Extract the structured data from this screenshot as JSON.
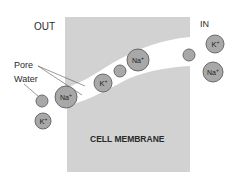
{
  "labels": {
    "out": "OUT",
    "in": "IN",
    "pore": "Pore",
    "water": "Water",
    "membrane": "CELL MEMBRANE"
  },
  "ions": [
    {
      "type": "K",
      "label": "K",
      "sup": "+",
      "cx": 103,
      "cy": 83,
      "r": 9
    },
    {
      "type": "water",
      "cx": 120,
      "cy": 71,
      "r": 6
    },
    {
      "type": "Na",
      "label": "Na",
      "sup": "+",
      "cx": 138,
      "cy": 60,
      "r": 11
    },
    {
      "type": "water",
      "cx": 189,
      "cy": 55,
      "r": 6
    },
    {
      "type": "K",
      "label": "K",
      "sup": "+",
      "cx": 215,
      "cy": 44,
      "r": 9
    },
    {
      "type": "Na",
      "label": "Na",
      "sup": "+",
      "cx": 213,
      "cy": 72,
      "r": 10
    },
    {
      "type": "Na",
      "label": "Na",
      "sup": "+",
      "cx": 66,
      "cy": 97,
      "r": 11
    },
    {
      "type": "water",
      "cx": 42,
      "cy": 101,
      "r": 6
    },
    {
      "type": "K",
      "label": "K",
      "sup": "+",
      "cx": 43,
      "cy": 121,
      "r": 8
    }
  ],
  "colors": {
    "membrane": "#d2d2d2",
    "ion_fill": "#a8a8a8",
    "ion_stroke": "#6a6a6a",
    "background": "#ffffff"
  }
}
